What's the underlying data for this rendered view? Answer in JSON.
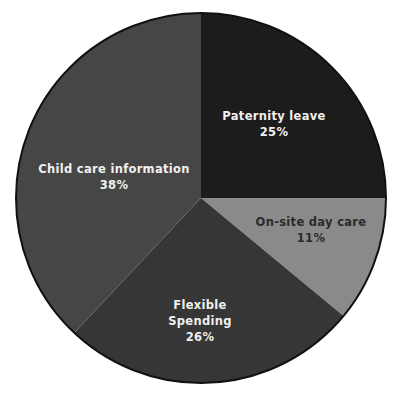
{
  "chart_data": {
    "type": "pie",
    "title": "",
    "categories": [
      "Paternity leave",
      "On-site day care",
      "Flexible Spending",
      "Child care information"
    ],
    "values": [
      25,
      11,
      26,
      38
    ],
    "unit": "%",
    "start_angle_deg": -90,
    "direction": "clockwise",
    "legend": "none (labels placed inside slices)",
    "slices": [
      {
        "label": "Paternity leave",
        "label_lines": [
          "Paternity leave"
        ],
        "value": 25,
        "value_label": "25%",
        "color": "#1c1c1c",
        "text_color": "#f0f0f0",
        "label_pos": [
          274,
          116
        ]
      },
      {
        "label": "On-site day care",
        "label_lines": [
          "On-site day care"
        ],
        "value": 11,
        "value_label": "11%",
        "color": "#8a8a8a",
        "text_color": "#2a2a2a",
        "label_pos": [
          311,
          222
        ]
      },
      {
        "label": "Flexible Spending",
        "label_lines": [
          "Flexible",
          "Spending"
        ],
        "value": 26,
        "value_label": "26%",
        "color": "#363636",
        "text_color": "#f0f0f0",
        "label_pos": [
          200,
          305
        ]
      },
      {
        "label": "Child care information",
        "label_lines": [
          "Child care information"
        ],
        "value": 38,
        "value_label": "38%",
        "color": "#464646",
        "text_color": "#f0f0f0",
        "label_pos": [
          114,
          169
        ]
      }
    ]
  },
  "geometry": {
    "cx": 201,
    "cy": 198,
    "r": 185,
    "outline_color": "#111111"
  }
}
